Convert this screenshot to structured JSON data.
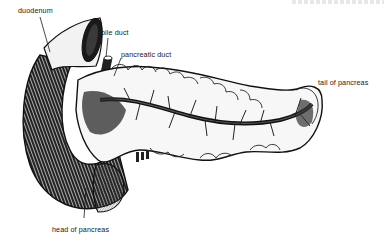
{
  "figure": {
    "colors": {
      "ink": "#1a1a1a",
      "background": "#ffffff",
      "shade": "#6a6a6a"
    },
    "labels": [
      {
        "id": "duodenum",
        "text": "duodenum"
      },
      {
        "id": "bile_duct",
        "text": "bile duct"
      },
      {
        "id": "pancreatic_duct",
        "text": "pancreatic duct"
      },
      {
        "id": "tail_of_pancreas",
        "text": "tail of pancreas"
      },
      {
        "id": "head_of_pancreas",
        "text": "head of pancreas"
      }
    ]
  }
}
